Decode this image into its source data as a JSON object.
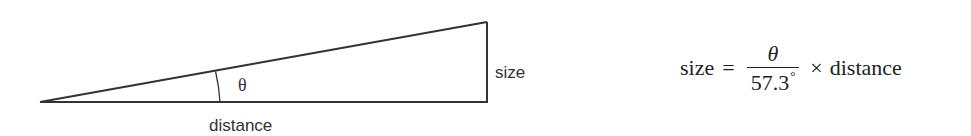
{
  "diagram": {
    "type": "right-triangle-small-angle",
    "labels": {
      "angle": "θ",
      "opposite_side": "size",
      "adjacent_side": "distance"
    },
    "geometry": {
      "apex": [
        40,
        102
      ],
      "base_right": [
        487,
        102
      ],
      "top_right": [
        487,
        22
      ],
      "arc_x": 220
    },
    "stroke_color": "#333333"
  },
  "formula": {
    "lhs": "size",
    "equals": "=",
    "numerator": "θ",
    "denominator": "57.3",
    "degree_symbol": "°",
    "times": "×",
    "rhs": "distance"
  }
}
